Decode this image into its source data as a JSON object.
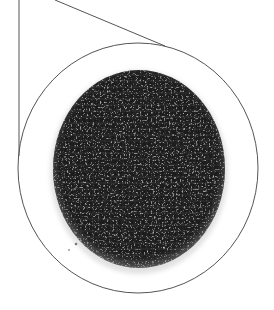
{
  "figure": {
    "width": 274,
    "height": 310,
    "background": "#ffffff"
  },
  "callout": {
    "stroke_color": "#555555",
    "stroke_width": 1,
    "lines": [
      {
        "name": "left-leader-line",
        "x1": 19,
        "y1": 0,
        "x2": 19,
        "y2": 156
      },
      {
        "name": "diagonal-leader-line",
        "x1": 55,
        "y1": 0,
        "x2": 165,
        "y2": 46
      }
    ],
    "circle": {
      "cx": 138,
      "cy": 168,
      "rx": 120,
      "ry": 125
    }
  },
  "specimen": {
    "cx": 139,
    "cy": 169,
    "rx": 86,
    "ry": 99,
    "base_color": "#1c1c1c",
    "speckle_color": "#9a9a9a",
    "edge_fade_color": "#cfcfcf"
  }
}
